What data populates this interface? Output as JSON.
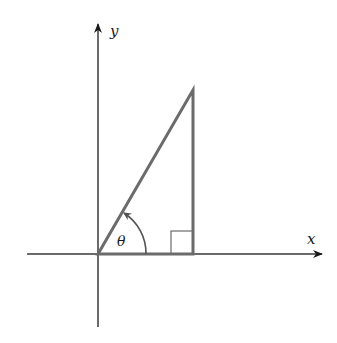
{
  "diagram": {
    "labels": {
      "x_axis": "x",
      "y_axis": "y",
      "angle": "θ"
    },
    "colors": {
      "axis": "#3a3a3a",
      "triangle": "#6b6b6b",
      "label": "#1a1a1a"
    },
    "geometry": {
      "origin": [
        98,
        254
      ],
      "x_axis_range": [
        27,
        322
      ],
      "y_axis_range": [
        24,
        327
      ],
      "triangle_vertices": [
        [
          98,
          254
        ],
        [
          193,
          254
        ],
        [
          193,
          90
        ]
      ],
      "right_angle_marker": {
        "x": 171,
        "y": 231,
        "size": 22
      },
      "angle_arc_radius": 48
    }
  }
}
